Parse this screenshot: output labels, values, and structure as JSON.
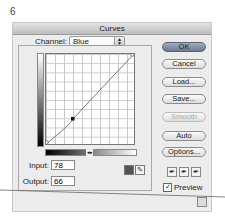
{
  "figure_number": "6",
  "dialog": {
    "title": "Curves",
    "channel": {
      "label": "Channel:",
      "value": "Blue"
    },
    "input": {
      "label": "Input:",
      "value": "78"
    },
    "output": {
      "label": "Output:",
      "value": "66"
    },
    "buttons": {
      "ok": "OK",
      "cancel": "Cancel",
      "load": "Load...",
      "save": "Save...",
      "smooth": "Smooth",
      "auto": "Auto",
      "options": "Options..."
    },
    "preview": {
      "label": "Preview",
      "checked": true
    },
    "gradient_marker": "◂▸",
    "curve": {
      "points": [
        [
          0,
          0
        ],
        [
          78,
          66
        ],
        [
          255,
          255
        ]
      ],
      "selected_point": [
        78,
        66
      ]
    }
  }
}
